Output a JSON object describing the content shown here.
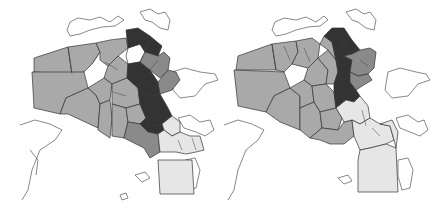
{
  "colors": {
    "background": "#ffffff",
    "light": "#e6e6e6",
    "medium": "#a9a9a9",
    "mid_dark": "#8a8a8a",
    "dark": "#333333",
    "white_sector": "#ffffff",
    "border": "#333333",
    "coast": "#555555"
  },
  "maps": [
    {
      "id": "left",
      "offset_x": 0,
      "coastlines": [
        "M70,22 L78,18 L90,20 L100,17 L110,22 L118,16 L124,20 L115,26 L102,27 L90,30 L80,34 L70,36 L67,30 Z",
        "M140,12 L150,9 L158,14 L165,12 L170,20 L168,30 L160,28 L152,22 L145,20 Z",
        "M172,72 L185,68 L200,72 L215,74 L218,80 L205,84 L195,96 L180,98 L173,90 Z",
        "M178,118 L190,115 L200,122 L210,120 L214,130 L205,136 L196,132 L184,128 Z",
        "M20,125 L35,120 L50,124 L62,130 L55,140 L40,150 L32,170 L28,190 L22,200 M30,150 L38,160 L36,175",
        "M135,175 L145,172 L150,178 L142,182 Z",
        "M120,195 L126,193 L128,198 L122,200 Z",
        "M185,160 L195,158 L200,170 L196,188 L188,190 L184,176 Z"
      ],
      "sectors": [
        {
          "shade": "medium",
          "points": "34,58 68,47 72,74 34,72"
        },
        {
          "shade": "medium",
          "points": "68,47 96,43 100,52 92,64 84,72 72,74"
        },
        {
          "shade": "medium",
          "points": "32,72 84,72 88,88 66,98 60,114 34,108"
        },
        {
          "shade": "medium",
          "points": "66,98 88,88 96,95 100,104 98,128 68,114 60,114"
        },
        {
          "shade": "medium",
          "points": "96,43 110,40 126,38 128,48 118,56 108,66 100,60 100,52"
        },
        {
          "shade": "medium",
          "points": "108,66 118,56 128,64 127,78 112,84 104,78"
        },
        {
          "shade": "medium",
          "points": "88,88 104,78 112,84 110,100 100,104 96,95"
        },
        {
          "shade": "medium",
          "points": "100,104 110,100 112,118 110,138 98,130"
        },
        {
          "shade": "medium",
          "points": "112,84 127,78 138,88 140,104 126,108 112,104"
        },
        {
          "shade": "medium",
          "points": "112,104 126,108 128,122 124,138 112,136 112,118"
        },
        {
          "shade": "medium",
          "points": "126,108 140,104 146,118 140,124 128,122"
        },
        {
          "shade": "white_sector",
          "points": "128,48 140,44 145,52 140,62 128,64 126,56"
        },
        {
          "shade": "dark",
          "points": "126,30 138,28 150,36 162,46 158,56 145,52 140,44 128,48"
        },
        {
          "shade": "dark",
          "points": "128,64 140,62 150,70 158,82 160,94 150,96 140,90 138,88 127,78"
        },
        {
          "shade": "dark",
          "points": "138,88 150,96 160,94 168,108 172,116 162,124 150,126 146,118 140,104"
        },
        {
          "shade": "dark",
          "points": "146,118 150,126 162,124 164,130 158,134 148,132 140,124"
        },
        {
          "shade": "mid_dark",
          "points": "145,52 158,56 164,52 170,58 168,70 160,78 150,70 140,62"
        },
        {
          "shade": "mid_dark",
          "points": "158,82 168,70 176,72 180,80 172,90 160,94"
        },
        {
          "shade": "mid_dark",
          "points": "140,124 148,132 158,134 160,152 150,158 144,148 136,144 128,140 124,138 128,122"
        },
        {
          "shade": "light",
          "points": "162,124 172,116 180,122 180,132 172,136 164,130"
        },
        {
          "shade": "light",
          "points": "158,134 164,130 172,136 180,132 190,136 200,136 204,150 196,152 186,154 176,152 160,152"
        },
        {
          "shade": "light",
          "points": "158,160 192,160 194,194 160,194"
        }
      ],
      "inner_lines": [
        "M68,47 L72,74",
        "M92,64 L100,52",
        "M105,62 L118,70",
        "M113,92 L126,96",
        "M150,40 L145,50",
        "M150,70 L158,60",
        "M160,100 L150,110",
        "M178,140 L182,150",
        "M192,138 L196,150"
      ]
    },
    {
      "id": "right",
      "offset_x": 220,
      "coastlines": [
        "M55,22 L64,18 L76,20 L86,17 L96,22 L104,16 L108,20 L100,26 L88,27 L76,30 L66,34 L56,36 L52,30 Z",
        "M126,12 L136,9 L144,14 L150,12 L156,20 L154,30 L146,28 L138,22 L132,20 Z",
        "M168,72 L180,68 L196,72 L206,74 L210,80 L198,84 L188,96 L172,98 L165,90 Z",
        "M176,118 L188,115 L198,122 L204,120 L208,130 L200,136 L190,132 L180,128 Z",
        "M4,125 L18,120 L32,124 L44,130 L38,140 L26,150 L18,170 L14,190 L8,200",
        "M118,178 L128,175 L132,181 L124,184 Z",
        "M178,160 L188,158 L193,170 L190,188 L182,190 L178,176 Z"
      ],
      "sectors": [
        {
          "shade": "medium",
          "points": "18,56 52,44 56,70 16,70"
        },
        {
          "shade": "medium",
          "points": "52,44 76,41 78,52 72,64 64,72 56,70"
        },
        {
          "shade": "medium",
          "points": "14,70 64,72 70,88 54,96 46,112 18,106"
        },
        {
          "shade": "medium",
          "points": "54,96 70,88 80,96 80,108 80,130 60,122 46,112"
        },
        {
          "shade": "medium",
          "points": "76,41 92,38 100,44 98,58 88,68 72,64 78,52"
        },
        {
          "shade": "medium",
          "points": "88,68 98,58 108,70 106,84 92,86 84,80"
        },
        {
          "shade": "medium",
          "points": "70,88 84,80 92,86 94,102 80,108 80,96"
        },
        {
          "shade": "medium",
          "points": "92,86 106,84 114,92 116,108 100,112 94,102"
        },
        {
          "shade": "medium",
          "points": "80,108 94,102 100,112 102,128 90,138 80,130"
        },
        {
          "shade": "medium",
          "points": "100,112 116,108 122,118 118,130 102,128"
        },
        {
          "shade": "medium",
          "points": "102,128 118,130 124,122 132,120 134,136 124,144 110,144 100,140 90,138"
        },
        {
          "shade": "medium",
          "points": "98,58 108,50 116,60 118,72 114,84 106,84 108,70"
        },
        {
          "shade": "medium",
          "points": "100,44 104,36 112,42 116,60 108,50"
        },
        {
          "shade": "dark",
          "points": "104,36 112,28 124,28 132,40 140,50 132,54 124,56 118,62 116,60 112,42"
        },
        {
          "shade": "dark",
          "points": "116,60 118,62 124,56 132,60 130,72 130,82 124,82 118,72"
        },
        {
          "shade": "dark",
          "points": "118,72 124,82 130,82 136,90 140,96 134,102 126,100 116,108 114,92 114,84"
        },
        {
          "shade": "mid_dark",
          "points": "124,56 132,54 140,50 150,48 156,52 154,68 148,74 138,76 130,72 132,60"
        },
        {
          "shade": "mid_dark",
          "points": "130,72 138,76 148,74 152,80 142,86 136,90 130,82"
        },
        {
          "shade": "light",
          "points": "116,108 126,100 134,102 140,96 148,106 150,118 140,124 132,120 124,122 122,118"
        },
        {
          "shade": "light",
          "points": "132,120 140,124 150,118 160,124 170,126 174,140 166,144 150,148 140,150 134,136"
        },
        {
          "shade": "light",
          "points": "140,150 150,148 166,144 176,148 178,192 138,192 138,160"
        },
        {
          "shade": "light",
          "points": "160,124 172,120 178,132 176,148 174,140 170,126"
        }
      ],
      "inner_lines": [
        "M52,44 L56,70",
        "M64,46 L70,60",
        "M84,48 L90,62",
        "M126,40 L120,52",
        "M140,60 L148,66",
        "M142,110 L146,126",
        "M152,128 L160,136"
      ]
    }
  ]
}
